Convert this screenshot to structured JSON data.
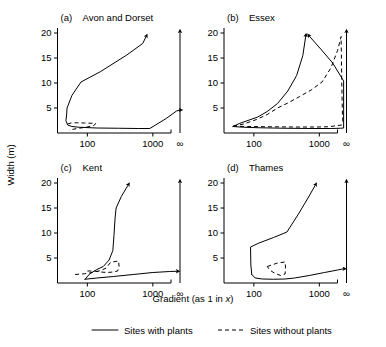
{
  "figure": {
    "axis_x_label": "Gradient  (as 1 in ",
    "axis_x_label_italic": "x",
    "axis_x_label_end": ")",
    "axis_y_label": "Width  (m)",
    "x_ticks": [
      "100",
      "1000",
      "∞"
    ],
    "y_ticks": [
      "5",
      "10",
      "15",
      "20"
    ],
    "ylim": [
      0,
      21
    ],
    "xlim_log": [
      1.55,
      3.42
    ]
  },
  "legend": {
    "position": "bottom-center",
    "items": [
      {
        "label": "Sites with plants",
        "style": "solid"
      },
      {
        "label": "Sites without plants",
        "style": "dashed"
      }
    ]
  },
  "chart_data": {
    "type": "line",
    "title": "",
    "xlabel": "Gradient (as 1 in x)",
    "ylabel": "Width (m)",
    "xscale": "log",
    "xlim": [
      35,
      2600
    ],
    "ylim": [
      0,
      21
    ],
    "x_tick_values": [
      100,
      1000,
      2600
    ],
    "x_tick_labels": [
      "100",
      "1000",
      "∞"
    ],
    "y_tick_values": [
      5,
      10,
      15,
      20
    ],
    "grid": false,
    "panels": [
      {
        "id": "a",
        "label": "(a)",
        "title": "Avon and Dorset",
        "series": [
          {
            "name": "Sites with plants",
            "style": "solid",
            "arrow_end": true,
            "points": [
              [
                48,
                3.3
              ],
              [
                47,
                2.5
              ],
              [
                50,
                1.6
              ],
              [
                58,
                1.3
              ],
              [
                75,
                1.15
              ],
              [
                140,
                1.0
              ],
              [
                300,
                0.95
              ],
              [
                600,
                0.9
              ],
              [
                900,
                0.9
              ],
              [
                1100,
                1.6
              ],
              [
                1600,
                2.9
              ],
              [
                2300,
                4.4
              ],
              [
                2600,
                4.6
              ],
              [
                2600,
                4.6
              ]
            ]
          },
          {
            "name": "Sites with plants (upper)",
            "style": "solid",
            "arrow_end": true,
            "points": [
              [
                48,
                3.3
              ],
              [
                49,
                5.0
              ],
              [
                58,
                7.5
              ],
              [
                80,
                10.2
              ],
              [
                160,
                12.3
              ],
              [
                400,
                15.6
              ],
              [
                700,
                17.9
              ],
              [
                790,
                19.3
              ]
            ]
          },
          {
            "name": "Sites without plants",
            "style": "dashed",
            "arrow_end": false,
            "points": [
              [
                50,
                1.8
              ],
              [
                56,
                2.0
              ],
              [
                68,
                2.05
              ],
              [
                90,
                2.0
              ],
              [
                120,
                1.95
              ],
              [
                135,
                1.9
              ],
              [
                125,
                1.5
              ],
              [
                95,
                1.15
              ],
              [
                70,
                0.9
              ],
              [
                58,
                0.7
              ],
              [
                53,
                0.55
              ]
            ]
          }
        ]
      },
      {
        "id": "b",
        "label": "(b)",
        "title": "Essex",
        "series": [
          {
            "name": "Sites with plants",
            "style": "solid",
            "arrow_end": true,
            "points": [
              [
                48,
                1.3
              ],
              [
                70,
                1.15
              ],
              [
                120,
                1.05
              ],
              [
                300,
                0.95
              ],
              [
                800,
                0.9
              ],
              [
                1500,
                0.9
              ],
              [
                2100,
                0.95
              ],
              [
                2350,
                1.0
              ],
              [
                2350,
                10.4
              ],
              [
                1600,
                14.0
              ],
              [
                1050,
                16.8
              ],
              [
                700,
                19.4
              ]
            ]
          },
          {
            "name": "Sites with plants (upper)",
            "style": "solid",
            "arrow_end": true,
            "points": [
              [
                48,
                1.3
              ],
              [
                60,
                1.9
              ],
              [
                85,
                2.6
              ],
              [
                115,
                3.2
              ],
              [
                160,
                4.3
              ],
              [
                230,
                5.9
              ],
              [
                330,
                8.4
              ],
              [
                450,
                11.5
              ],
              [
                560,
                15.5
              ],
              [
                620,
                19.4
              ]
            ]
          },
          {
            "name": "Sites without plants (lower)",
            "style": "dashed",
            "arrow_end": false,
            "points": [
              [
                48,
                1.35
              ],
              [
                80,
                1.3
              ],
              [
                150,
                1.25
              ],
              [
                400,
                1.2
              ],
              [
                900,
                1.2
              ],
              [
                1400,
                1.25
              ],
              [
                1900,
                1.5
              ],
              [
                2200,
                1.6
              ],
              [
                2350,
                1.6
              ]
            ]
          },
          {
            "name": "Sites without plants (upper)",
            "style": "dashed",
            "arrow_end": false,
            "points": [
              [
                48,
                1.35
              ],
              [
                70,
                1.8
              ],
              [
                110,
                2.7
              ],
              [
                160,
                3.7
              ],
              [
                230,
                5.0
              ],
              [
                330,
                6.0
              ],
              [
                500,
                7.3
              ],
              [
                750,
                8.6
              ],
              [
                1100,
                10.2
              ],
              [
                1500,
                13.0
              ],
              [
                1900,
                16.5
              ],
              [
                2150,
                19.3
              ],
              [
                2200,
                10.4
              ],
              [
                2250,
                4.0
              ],
              [
                2300,
                1.7
              ]
            ]
          }
        ]
      },
      {
        "id": "c",
        "label": "(c)",
        "title": "Kent",
        "series": [
          {
            "name": "Sites with plants",
            "style": "solid",
            "arrow_end": true,
            "points": [
              [
                92,
                0.75
              ],
              [
                140,
                1.0
              ],
              [
                250,
                1.3
              ],
              [
                500,
                1.7
              ],
              [
                1000,
                2.1
              ],
              [
                1800,
                2.3
              ],
              [
                2350,
                2.35
              ],
              [
                2350,
                2.35
              ]
            ]
          },
          {
            "name": "Sites with plants (upper)",
            "style": "solid",
            "arrow_end": true,
            "points": [
              [
                92,
                0.75
              ],
              [
                110,
                1.9
              ],
              [
                140,
                2.7
              ],
              [
                175,
                3.3
              ],
              [
                215,
                4.6
              ],
              [
                245,
                6.5
              ],
              [
                255,
                9.5
              ],
              [
                265,
                13.0
              ],
              [
                275,
                15.0
              ],
              [
                330,
                17.3
              ],
              [
                420,
                19.6
              ]
            ]
          },
          {
            "name": "Sites without plants",
            "style": "dashed",
            "arrow_end": false,
            "points": [
              [
                65,
                1.7
              ],
              [
                90,
                1.85
              ],
              [
                120,
                2.1
              ],
              [
                160,
                2.5
              ],
              [
                195,
                3.0
              ],
              [
                225,
                4.1
              ],
              [
                265,
                4.3
              ],
              [
                300,
                4.4
              ],
              [
                305,
                3.3
              ],
              [
                290,
                2.4
              ],
              [
                250,
                2.2
              ],
              [
                200,
                2.1
              ],
              [
                160,
                2.2
              ],
              [
                125,
                2.4
              ],
              [
                95,
                2.4
              ]
            ]
          }
        ]
      },
      {
        "id": "d",
        "label": "(d)",
        "title": "Thames",
        "series": [
          {
            "name": "Sites with plants",
            "style": "solid",
            "arrow_end": true,
            "points": [
              [
                93,
                1.7
              ],
              [
                105,
                1.0
              ],
              [
                135,
                0.8
              ],
              [
                200,
                0.75
              ],
              [
                300,
                0.8
              ],
              [
                420,
                1.0
              ],
              [
                700,
                1.5
              ],
              [
                1200,
                2.1
              ],
              [
                1900,
                2.6
              ],
              [
                2350,
                2.85
              ],
              [
                2350,
                2.85
              ]
            ]
          },
          {
            "name": "Sites with plants (upper)",
            "style": "solid",
            "arrow_end": true,
            "points": [
              [
                93,
                1.7
              ],
              [
                90,
                3.6
              ],
              [
                89,
                7.2
              ],
              [
                120,
                8.0
              ],
              [
                200,
                9.1
              ],
              [
                320,
                10.2
              ],
              [
                480,
                13.8
              ],
              [
                700,
                17.4
              ],
              [
                870,
                19.6
              ]
            ]
          },
          {
            "name": "Sites without plants",
            "style": "dashed",
            "arrow_end": false,
            "points": [
              [
                160,
                3.3
              ],
              [
                230,
                4.0
              ],
              [
                300,
                4.2
              ],
              [
                305,
                3.0
              ],
              [
                300,
                1.8
              ],
              [
                255,
                1.5
              ],
              [
                205,
                2.0
              ],
              [
                175,
                2.6
              ],
              [
                160,
                3.3
              ]
            ]
          }
        ]
      }
    ]
  }
}
